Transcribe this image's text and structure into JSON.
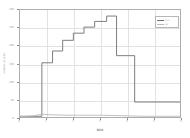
{
  "figure": {
    "background": "#ffffff",
    "frame_color": "#aeaeae",
    "grid_color": "#e2e2e2"
  },
  "axes": {
    "xlabel": "BVA",
    "ylabel": "number of users",
    "xticks": [
      "0",
      "1",
      "2",
      "3",
      "4",
      "5",
      "6"
    ],
    "yticks": [
      "0",
      "50",
      "100",
      "150",
      "200",
      "250",
      "300"
    ],
    "xlim": [
      0,
      6
    ],
    "ylim": [
      0,
      300
    ],
    "grid": "both"
  },
  "legend": {
    "position": "upper-right",
    "entries": [
      {
        "label": "sim",
        "color": "#6f6f6f"
      },
      {
        "label": "ref",
        "color": "#b9b9b9"
      }
    ]
  },
  "chart_data": {
    "type": "line",
    "title": "",
    "xlabel": "BVA",
    "ylabel": "number of users",
    "xlim": [
      0,
      6
    ],
    "ylim": [
      0,
      300
    ],
    "grid": true,
    "legend_position": "upper-right",
    "drawstyle": "steps-post",
    "series": [
      {
        "name": "sim",
        "color": "#6f6f6f",
        "x": [
          0.0,
          0.82,
          0.82,
          1.22,
          1.22,
          1.6,
          1.6,
          2.0,
          2.0,
          2.4,
          2.4,
          2.8,
          2.8,
          3.25,
          3.25,
          3.62,
          3.62,
          3.62,
          4.3,
          4.3,
          6.0
        ],
        "y": [
          2,
          2,
          152,
          152,
          185,
          185,
          215,
          215,
          235,
          235,
          252,
          252,
          268,
          268,
          283,
          283,
          283,
          172,
          172,
          42,
          42
        ],
        "steps": [
          {
            "x_start": 0.0,
            "x_end": 0.82,
            "y": 2
          },
          {
            "x_start": 0.82,
            "x_end": 1.22,
            "y": 152
          },
          {
            "x_start": 1.22,
            "x_end": 1.6,
            "y": 185
          },
          {
            "x_start": 1.6,
            "x_end": 2.0,
            "y": 215
          },
          {
            "x_start": 2.0,
            "x_end": 2.4,
            "y": 235
          },
          {
            "x_start": 2.4,
            "x_end": 2.8,
            "y": 252
          },
          {
            "x_start": 2.8,
            "x_end": 3.25,
            "y": 268
          },
          {
            "x_start": 3.25,
            "x_end": 3.62,
            "y": 283
          },
          {
            "x_start": 3.62,
            "x_end": 4.3,
            "y": 172
          },
          {
            "x_start": 4.3,
            "x_end": 6.0,
            "y": 42
          }
        ]
      },
      {
        "name": "ref",
        "color": "#b9b9b9",
        "x": [
          0.0,
          0.5,
          0.82,
          1.2,
          1.8,
          2.4,
          3.0,
          3.6,
          4.1,
          4.6,
          5.2,
          6.0
        ],
        "y": [
          1,
          3,
          8,
          6,
          5,
          5,
          5,
          4,
          3,
          2,
          2,
          2
        ]
      }
    ]
  }
}
